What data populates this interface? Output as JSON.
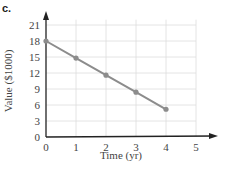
{
  "panel_label": "c.",
  "chart_data": {
    "type": "line",
    "title": "",
    "xlabel": "Time (yr)",
    "ylabel": "Value ($1000)",
    "x": [
      0,
      1,
      2,
      3,
      4
    ],
    "series": [
      {
        "name": "Value",
        "values": [
          18,
          14.8,
          11.6,
          8.4,
          5.2
        ]
      }
    ],
    "xticks": [
      "0",
      "1",
      "2",
      "3",
      "4",
      "5"
    ],
    "yticks": [
      "0",
      "3",
      "6",
      "9",
      "12",
      "15",
      "18",
      "21"
    ],
    "xlim": [
      0,
      5
    ],
    "ylim": [
      0,
      21
    ],
    "grid": true,
    "line_color": "#8c8c8c"
  }
}
